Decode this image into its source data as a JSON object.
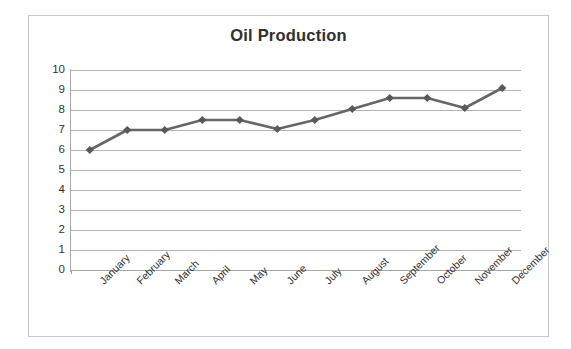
{
  "chart_data": {
    "type": "line",
    "title": "Oil Production",
    "xlabel": "",
    "ylabel": "",
    "categories": [
      "January",
      "February",
      "March",
      "April",
      "May",
      "June",
      "July",
      "August",
      "September",
      "October",
      "November",
      "December"
    ],
    "values": [
      6.0,
      7.0,
      7.0,
      7.5,
      7.5,
      7.05,
      7.5,
      8.05,
      8.6,
      8.6,
      8.1,
      9.1
    ],
    "series": [
      {
        "name": "Oil Production",
        "values": [
          6.0,
          7.0,
          7.0,
          7.5,
          7.5,
          7.05,
          7.5,
          8.05,
          8.6,
          8.6,
          8.1,
          9.1
        ]
      }
    ],
    "ylim": [
      0,
      10
    ],
    "y_ticks": [
      0,
      1,
      2,
      3,
      4,
      5,
      6,
      7,
      8,
      9,
      10
    ],
    "y_tick_labels": [
      "0",
      "1",
      "2",
      "3",
      "4",
      "5",
      "6",
      "7",
      "8",
      "9",
      "10"
    ],
    "grid": true,
    "grid_axis": "y",
    "legend": false,
    "legend_position": "none",
    "marker": "diamond",
    "line_color": "#666666",
    "marker_color": "#595959",
    "gridline_color": "#b4b4b4",
    "axis_color": "#a8a8a8",
    "title_color": "#2f2f2f",
    "tick_label_color": "#333333",
    "background_color": "#ffffff",
    "border_color": "#c9c9c9",
    "x_tick_label_rotation": -45
  }
}
